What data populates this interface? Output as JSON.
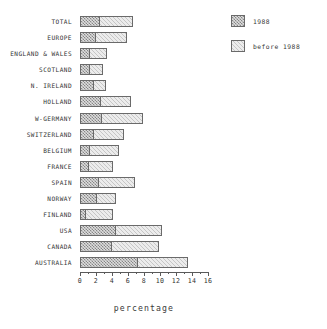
{
  "chart_data": {
    "type": "bar",
    "orientation": "horizontal",
    "stacked": true,
    "title": "",
    "xlabel": "percentage",
    "ylabel": "",
    "xlim": [
      0,
      16
    ],
    "xticks": [
      0,
      2,
      4,
      6,
      8,
      10,
      12,
      14,
      16
    ],
    "xtick_labels": [
      "0",
      "2",
      "4",
      "6",
      "8",
      "10",
      "12",
      "14",
      "16"
    ],
    "minor_xticks": [
      1,
      3,
      5,
      7,
      9,
      11,
      13,
      15
    ],
    "grid": false,
    "legend_position": "top-right",
    "categories": [
      "TOTAL",
      "EUROPE",
      "ENGLAND & WALES",
      "SCOTLAND",
      "N. IRELAND",
      "HOLLAND",
      "W-GERMANY",
      "SWITZERLAND",
      "BELGIUM",
      "FRANCE",
      "SPAIN",
      "NORWAY",
      "FINLAND",
      "USA",
      "CANADA",
      "AUSTRALIA"
    ],
    "series": [
      {
        "name": "1988",
        "values": [
          2.5,
          2.0,
          1.3,
          1.2,
          1.8,
          2.6,
          2.8,
          1.7,
          1.2,
          1.1,
          2.4,
          2.1,
          0.7,
          4.5,
          4.0,
          7.3
        ]
      },
      {
        "name": "before 1988",
        "values": [
          4.3,
          4.0,
          2.2,
          1.8,
          1.6,
          3.9,
          5.2,
          3.9,
          3.8,
          3.2,
          4.6,
          2.5,
          3.6,
          5.9,
          6.0,
          6.3
        ]
      }
    ],
    "totals": [
      6.8,
      6.0,
      3.5,
      3.0,
      3.4,
      6.5,
      8.0,
      5.6,
      5.0,
      4.3,
      7.0,
      4.6,
      4.3,
      10.4,
      10.0,
      13.6
    ]
  },
  "legend": {
    "entries": [
      {
        "label": "1988",
        "swatch": "hatched-dark-gray"
      },
      {
        "label": "before 1988",
        "swatch": "stipple-light-gray"
      }
    ]
  },
  "colors": {
    "series_1988": "#b4b4b4",
    "series_before_1988": "#ececec",
    "outline": "#6a6a6a",
    "text": "#333333",
    "background": "#ffffff"
  }
}
